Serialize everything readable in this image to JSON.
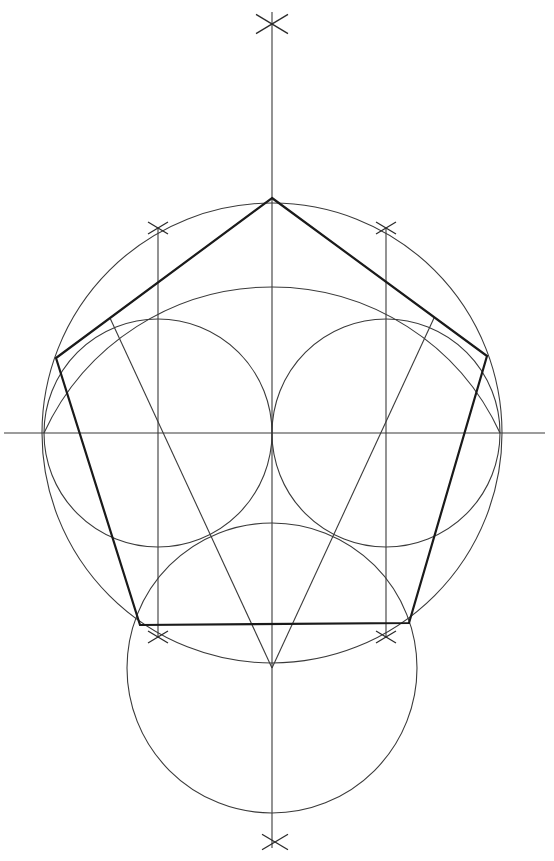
{
  "diagram": {
    "canvas": {
      "width": 554,
      "height": 861,
      "background": "#ffffff"
    },
    "colors": {
      "line": "#3a3a3a",
      "pentagon": "#1a1a1a"
    },
    "axes": {
      "vertical": {
        "x": 272,
        "y1": 12,
        "y2": 848
      },
      "horizontal": {
        "y": 433,
        "x1": 4,
        "x2": 545
      }
    },
    "circles": [
      {
        "name": "circumscribed-circle",
        "cx": 272,
        "cy": 433,
        "r": 230
      },
      {
        "name": "left-small-circle",
        "cx": 158,
        "cy": 433,
        "r": 114
      },
      {
        "name": "right-small-circle",
        "cx": 386,
        "cy": 433,
        "r": 114
      },
      {
        "name": "lower-circle",
        "cx": 272,
        "cy": 668,
        "r": 145
      }
    ],
    "arcs": [
      {
        "name": "upper-arc",
        "d": "M 44 433 A 251 251 0 0 1 500 433"
      }
    ],
    "pentagon": {
      "vertices": [
        [
          272,
          198
        ],
        [
          487,
          356
        ],
        [
          409,
          623
        ],
        [
          140,
          625
        ],
        [
          56,
          358
        ]
      ]
    },
    "construction_lines": [
      {
        "name": "left-vertical",
        "x1": 158,
        "y1": 228,
        "x2": 158,
        "y2": 638
      },
      {
        "name": "right-vertical",
        "x1": 386,
        "y1": 228,
        "x2": 386,
        "y2": 638
      },
      {
        "name": "left-diagonal",
        "x1": 272,
        "y1": 668,
        "x2": 110,
        "y2": 318
      },
      {
        "name": "right-diagonal",
        "x1": 272,
        "y1": 668,
        "x2": 434,
        "y2": 318
      }
    ],
    "cross_marks": [
      {
        "name": "top-cross",
        "x": 272,
        "y": 24,
        "s": 16
      },
      {
        "name": "bottom-cross",
        "x": 275,
        "y": 842,
        "s": 13
      },
      {
        "name": "upper-left-cross",
        "x": 158,
        "y": 228,
        "s": 10
      },
      {
        "name": "upper-right-cross",
        "x": 386,
        "y": 228,
        "s": 10
      },
      {
        "name": "lower-left-cross",
        "x": 158,
        "y": 637,
        "s": 10
      },
      {
        "name": "lower-right-cross",
        "x": 386,
        "y": 637,
        "s": 10
      }
    ]
  }
}
